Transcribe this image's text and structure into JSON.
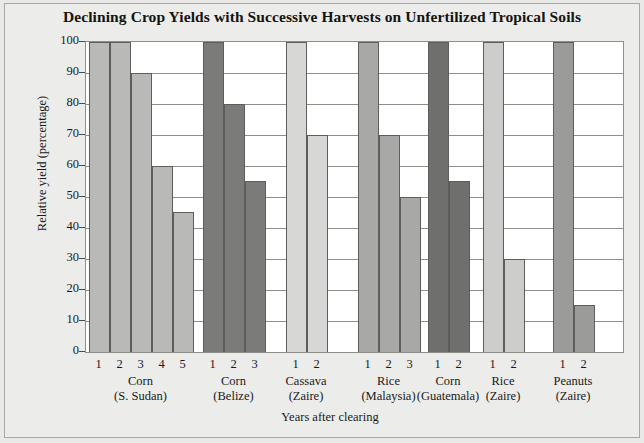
{
  "chart_data": {
    "type": "bar",
    "title": "Declining Crop Yields with Successive Harvests on Unfertilized Tropical Soils",
    "xlabel": "Years after clearing",
    "ylabel": "Relative yield (percentage)",
    "ylim": [
      0,
      100
    ],
    "ytick_labels": [
      "100",
      "90",
      "80",
      "70",
      "60",
      "50",
      "40",
      "30",
      "20",
      "10",
      "0"
    ],
    "yticks": [
      100,
      90,
      80,
      70,
      60,
      50,
      40,
      30,
      20,
      10,
      0
    ],
    "grid": true,
    "legend": "none",
    "groups": [
      {
        "crop": "Corn",
        "place": "(S. Sudan)",
        "color": "#b9b9b7",
        "x": [
          "1",
          "2",
          "3",
          "4",
          "5"
        ],
        "values": [
          100,
          100,
          90,
          60,
          45
        ]
      },
      {
        "crop": "Corn",
        "place": "(Belize)",
        "color": "#7b7b79",
        "x": [
          "1",
          "2",
          "3"
        ],
        "values": [
          100,
          80,
          55
        ]
      },
      {
        "crop": "Cassava",
        "place": "(Zaire)",
        "color": "#d7d7d5",
        "x": [
          "1",
          "2"
        ],
        "values": [
          100,
          70
        ]
      },
      {
        "crop": "Rice",
        "place": "(Malaysia)",
        "color": "#a8a8a6",
        "x": [
          "1",
          "2",
          "3"
        ],
        "values": [
          100,
          70,
          50
        ]
      },
      {
        "crop": "Corn",
        "place": "(Guatemala)",
        "color": "#6f6f6d",
        "x": [
          "1",
          "2"
        ],
        "values": [
          100,
          55
        ]
      },
      {
        "crop": "Rice",
        "place": "(Zaire)",
        "color": "#cdcdcb",
        "x": [
          "1",
          "2"
        ],
        "values": [
          100,
          30
        ]
      },
      {
        "crop": "Peanuts",
        "place": "(Zaire)",
        "color": "#9b9b99",
        "x": [
          "1",
          "2"
        ],
        "values": [
          100,
          15
        ]
      }
    ]
  }
}
